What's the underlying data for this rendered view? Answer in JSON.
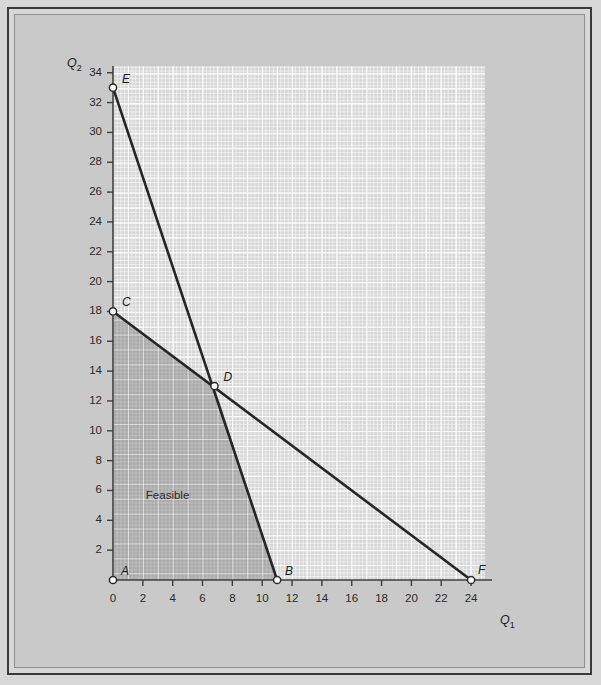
{
  "chart_data": {
    "type": "line",
    "title": "",
    "xlabel": "Q1",
    "ylabel": "Q2",
    "xlim": [
      0,
      25
    ],
    "ylim": [
      0,
      34.5
    ],
    "grid": true,
    "legend_position": "none",
    "x_ticks": [
      0,
      2,
      4,
      6,
      8,
      10,
      12,
      14,
      16,
      18,
      20,
      22,
      24
    ],
    "y_ticks": [
      2,
      4,
      6,
      8,
      10,
      12,
      14,
      16,
      18,
      20,
      22,
      24,
      26,
      28,
      30,
      32,
      34
    ],
    "series": [
      {
        "name": "Constraint EB",
        "points": [
          [
            0,
            33
          ],
          [
            11,
            0
          ]
        ],
        "color": "#262626"
      },
      {
        "name": "Constraint CF",
        "points": [
          [
            0,
            18
          ],
          [
            24,
            0
          ]
        ],
        "color": "#262626"
      }
    ],
    "labeled_points": [
      {
        "id": "A",
        "label": "A",
        "x": 0,
        "y": 0,
        "lx": 8,
        "ly": -16
      },
      {
        "id": "B",
        "label": "B",
        "x": 11,
        "y": 0,
        "lx": 8,
        "ly": -16
      },
      {
        "id": "C",
        "label": "C",
        "x": 0,
        "y": 18,
        "lx": 9,
        "ly": -16
      },
      {
        "id": "D",
        "label": "D",
        "x": 6.8,
        "y": 13,
        "lx": 9,
        "ly": -16
      },
      {
        "id": "E",
        "label": "E",
        "x": 0,
        "y": 33,
        "lx": 9,
        "ly": -16
      },
      {
        "id": "F",
        "label": "F",
        "x": 24,
        "y": 0,
        "lx": 7,
        "ly": -17
      }
    ],
    "annotations": [
      {
        "text": "Feasible",
        "x": 2.2,
        "y": 5.6
      }
    ],
    "feasible_region": {
      "label": "Feasible",
      "vertices": [
        [
          0,
          0
        ],
        [
          0,
          18
        ],
        [
          6.8,
          13
        ],
        [
          11,
          0
        ]
      ],
      "fill_color": "#a9a9a9"
    }
  },
  "axes": {
    "x_title": "Q",
    "x_sub": "1",
    "y_title": "Q",
    "y_sub": "2"
  },
  "colors": {
    "page_background": "#d7d7d7",
    "plot_background": "#d6d6d6",
    "feasible_fill": "#a9a9a9",
    "grid_line": "#ffffff",
    "line_color": "#262626",
    "axis_color": "#3f3f3f",
    "frame_outer": "#3a3a3a",
    "frame_inner": "#8d8d8d"
  }
}
